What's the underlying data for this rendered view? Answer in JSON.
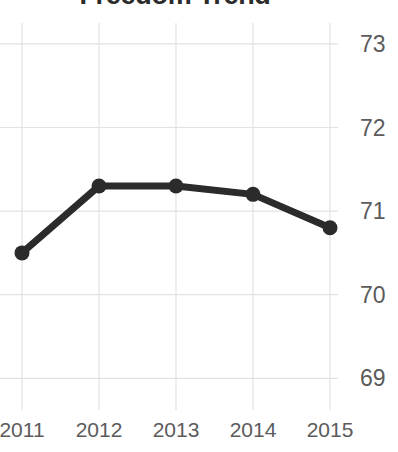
{
  "chart_data": {
    "type": "line",
    "title": "Freedom Trend",
    "xlabel": "",
    "ylabel": "",
    "categories": [
      "2011",
      "2012",
      "2013",
      "2014",
      "2015"
    ],
    "x": [
      2011,
      2012,
      2013,
      2014,
      2015
    ],
    "values": [
      70.5,
      71.3,
      71.3,
      71.2,
      70.8
    ],
    "series": [
      {
        "name": "Freedom",
        "values": [
          70.5,
          71.3,
          71.3,
          71.2,
          70.8
        ]
      }
    ],
    "ylim": [
      68.8,
      73.25
    ],
    "xlim": [
      2010.8,
      2015.15
    ],
    "y_ticks": [
      69,
      70,
      71,
      72,
      73
    ],
    "y_tick_labels": [
      "69",
      "70",
      "71",
      "72",
      "73"
    ],
    "x_ticks": [
      2011,
      2012,
      2013,
      2014,
      2015
    ],
    "x_tick_labels": [
      "2011",
      "2012",
      "2013",
      "2014",
      "2015"
    ],
    "grid": true,
    "grid_axes": "both",
    "legend": false,
    "legend_position": "none",
    "markers": true,
    "marker_shape": "circle",
    "y_axis_side": "right",
    "colors": {
      "line": "#2b2b2b",
      "marker": "#2b2b2b",
      "grid": "#e2e2e2",
      "tick_label": "#5b5b5b",
      "title": "#2b2b2b",
      "background": "#ffffff"
    }
  }
}
